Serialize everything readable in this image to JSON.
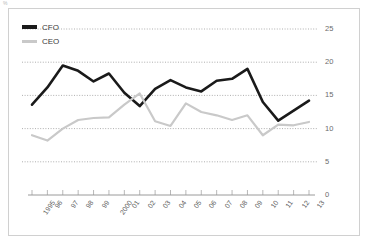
{
  "corner_unit": "%",
  "legend": {
    "position": "top-left",
    "entries": [
      {
        "label": "CFO",
        "color": "#1a1a1a"
      },
      {
        "label": "CEO",
        "color": "#c9c9c9"
      }
    ]
  },
  "chart_data": {
    "type": "line",
    "title": "",
    "subtitle": "",
    "xlabel": "",
    "ylabel": "%",
    "grid": true,
    "legend_position": "top-left",
    "ylim": [
      0,
      25
    ],
    "yticks": [
      0,
      5,
      10,
      15,
      20,
      25
    ],
    "categories": [
      "1995",
      "96",
      "97",
      "98",
      "99",
      "2000",
      "01",
      "02",
      "03",
      "04",
      "05",
      "06",
      "07",
      "08",
      "09",
      "10",
      "11",
      "12",
      "13"
    ],
    "series": [
      {
        "name": "CFO",
        "color": "#1a1a1a",
        "values": [
          13.6,
          16.2,
          19.5,
          18.7,
          17.1,
          18.3,
          15.4,
          13.4,
          16.0,
          17.3,
          16.2,
          15.6,
          17.2,
          17.5,
          19.0,
          14.0,
          11.2,
          12.7,
          14.2
        ]
      },
      {
        "name": "CEO",
        "color": "#c9c9c9",
        "values": [
          9.0,
          8.2,
          10.0,
          11.3,
          11.6,
          11.7,
          13.6,
          15.3,
          11.1,
          10.4,
          13.8,
          12.5,
          12.0,
          11.3,
          12.0,
          9.0,
          10.6,
          10.5,
          11.0
        ]
      }
    ]
  }
}
